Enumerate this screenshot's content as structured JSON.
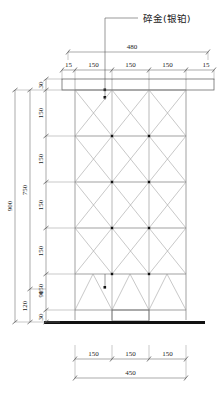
{
  "drawing": {
    "title_note": "碎金(银铂)",
    "units_implied": "mm",
    "view": "front-elevation"
  },
  "annotations": {
    "material_label": "碎金(银铂)"
  },
  "dimensions": {
    "top_chain": {
      "segments": [
        "15",
        "150",
        "150",
        "150",
        "15"
      ],
      "total": "480"
    },
    "bottom_chain": {
      "segments": [
        "150",
        "150",
        "150"
      ],
      "total": "450"
    },
    "left_inner_chain": {
      "segments": [
        "30",
        "150",
        "150",
        "150",
        "150",
        "150",
        "90",
        "30"
      ]
    },
    "left_middle_chain": {
      "segments": [
        "750",
        "120"
      ]
    },
    "left_outer_chain": {
      "total": "900"
    }
  },
  "structure": {
    "bays_horizontal": 3,
    "bays_vertical": 5,
    "bracing": "cross-x",
    "top_beam": "header-band",
    "base": "floor-line",
    "base_box": "footing-box"
  },
  "colors": {
    "line": "#6b6b6b",
    "brace": "#9a9a9a",
    "dim": "#555555",
    "text": "#222222",
    "base": "#111111"
  }
}
